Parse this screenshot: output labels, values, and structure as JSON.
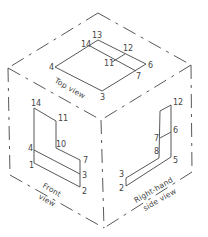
{
  "figure": {
    "type": "isometric glass-box projection",
    "faces": {
      "top": {
        "caption": "Top view",
        "vertex_labels": [
          "13",
          "14",
          "12",
          "11",
          "4",
          "6",
          "7",
          "3"
        ]
      },
      "front": {
        "caption_line1": "Front",
        "caption_line2": "view",
        "vertex_labels": [
          "14",
          "11",
          "10",
          "4",
          "7",
          "1",
          "3",
          "2"
        ]
      },
      "right": {
        "caption_line1": "Right-hand",
        "caption_line2": "side view",
        "vertex_labels": [
          "12",
          "6",
          "7",
          "8",
          "5",
          "3",
          "2"
        ]
      }
    },
    "colors": {
      "line": "#444444",
      "background": "#ffffff"
    }
  }
}
